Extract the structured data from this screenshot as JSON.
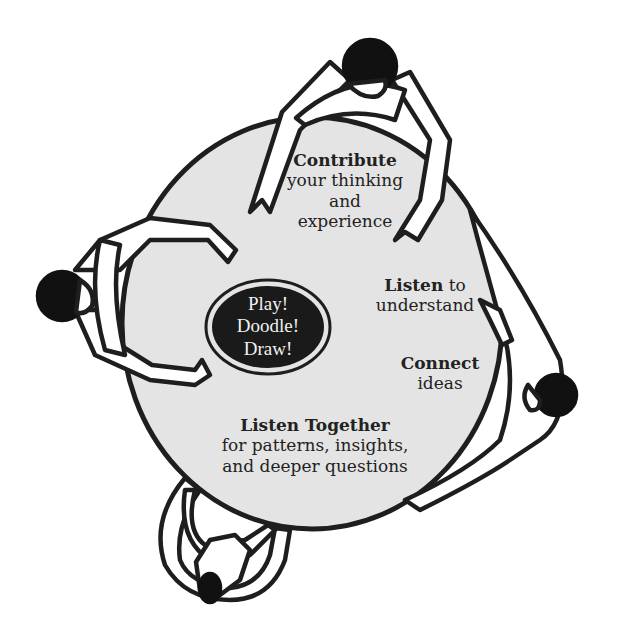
{
  "diagram": {
    "colors": {
      "background": "#ffffff",
      "table_fill": "#e4e4e4",
      "outline": "#1e1e1e",
      "center_fill": "#1a1a1a",
      "center_text": "#f0f0f0",
      "text": "#222222"
    },
    "center": {
      "lines": [
        "Play!",
        "Doodle!",
        "Draw!"
      ]
    },
    "labels": {
      "contribute": {
        "bold": "Contribute",
        "rest_lines": [
          "your thinking",
          "and",
          "experience"
        ]
      },
      "listen": {
        "bold": "Listen",
        "rest_inline": " to",
        "rest_lines": [
          "understand"
        ]
      },
      "connect": {
        "bold": "Connect",
        "rest_lines": [
          "ideas"
        ]
      },
      "listen_together": {
        "bold": "Listen Together",
        "rest_lines": [
          "for patterns, insights,",
          "and deeper questions"
        ]
      }
    },
    "figures": [
      {
        "position": "top",
        "icon": "person-topdown-icon"
      },
      {
        "position": "left",
        "icon": "person-topdown-icon"
      },
      {
        "position": "right",
        "icon": "person-topdown-icon"
      },
      {
        "position": "bottom",
        "icon": "person-topdown-icon"
      }
    ]
  }
}
